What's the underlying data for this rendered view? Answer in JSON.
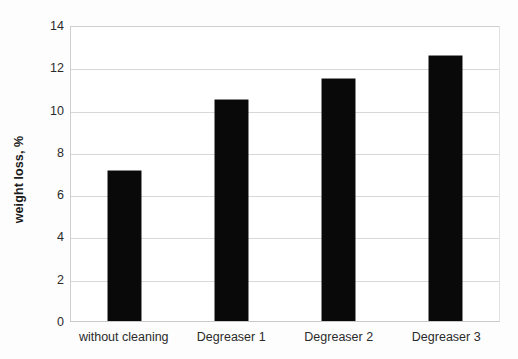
{
  "chart_data": {
    "type": "bar",
    "title": "",
    "xlabel": "",
    "ylabel": "weight loss, %",
    "categories": [
      "without cleaning",
      "Degreaser 1",
      "Degreaser 2",
      "Degreaser 3"
    ],
    "values": [
      7.1,
      10.45,
      11.45,
      12.55
    ],
    "series": [
      {
        "name": "weight loss",
        "values": [
          7.1,
          10.45,
          11.45,
          12.55
        ],
        "color": "#090909"
      }
    ],
    "ylim": [
      0,
      14
    ],
    "ytick_step": 2,
    "yticks": [
      0,
      2,
      4,
      6,
      8,
      10,
      12,
      14
    ],
    "ytick_labels": [
      "0",
      "2",
      "4",
      "6",
      "8",
      "10",
      "12",
      "14"
    ],
    "grid": "horizontal",
    "legend": "none",
    "bar_color": "#090909",
    "plot_background": "#ffffff",
    "gridline_color": "#d8d8d8",
    "axis_border_color": "#d2d2d2"
  }
}
